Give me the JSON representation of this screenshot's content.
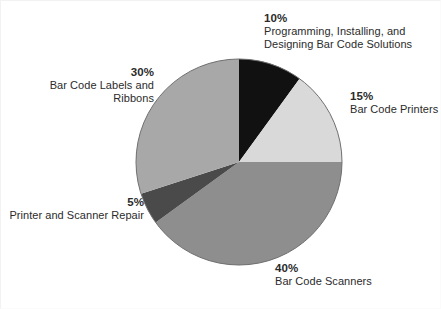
{
  "chart_data": {
    "type": "pie",
    "title": "",
    "subtitle": "",
    "xlabel": "",
    "ylabel": "",
    "legend_position": "callouts-around-pie",
    "grid": false,
    "start_angle_deg": 0,
    "direction": "clockwise",
    "center": {
      "x": 239,
      "y": 162
    },
    "radius": 103,
    "categories": [
      "Programming, Installing, and Designing Bar Code Solutions",
      "Bar Code Printers",
      "Bar Code Scanners",
      "Printer and Scanner Repair",
      "Bar Code Labels and Ribbons"
    ],
    "values": [
      10,
      15,
      40,
      5,
      30
    ],
    "value_labels": [
      "10%",
      "15%",
      "40%",
      "5%",
      "30%"
    ],
    "colors": [
      "#111111",
      "#d9d9d9",
      "#8e8e8e",
      "#4a4a4a",
      "#a8a8a8"
    ],
    "slices": [
      {
        "id": "programming",
        "percent": 10,
        "percent_label": "10%",
        "label_line1": "Programming, Installing, and",
        "label_line2": "Designing Bar Code Solutions",
        "color": "#111111",
        "start_deg": 0,
        "end_deg": 36
      },
      {
        "id": "printers",
        "percent": 15,
        "percent_label": "15%",
        "label_line1": "Bar Code Printers",
        "label_line2": "",
        "color": "#d9d9d9",
        "start_deg": 36,
        "end_deg": 90
      },
      {
        "id": "scanners",
        "percent": 40,
        "percent_label": "40%",
        "label_line1": "Bar Code Scanners",
        "label_line2": "",
        "color": "#8e8e8e",
        "start_deg": 90,
        "end_deg": 234
      },
      {
        "id": "repair",
        "percent": 5,
        "percent_label": "5%",
        "label_line1": "Printer and Scanner Repair",
        "label_line2": "",
        "color": "#4a4a4a",
        "start_deg": 234,
        "end_deg": 252
      },
      {
        "id": "labels",
        "percent": 30,
        "percent_label": "30%",
        "label_line1": "Bar Code Labels and",
        "label_line2": "Ribbons",
        "color": "#a8a8a8",
        "start_deg": 252,
        "end_deg": 360
      }
    ]
  },
  "style": {
    "background": "#ffffff",
    "text_color": "#2b2b2b",
    "outline_color": "#6f6f6f"
  }
}
